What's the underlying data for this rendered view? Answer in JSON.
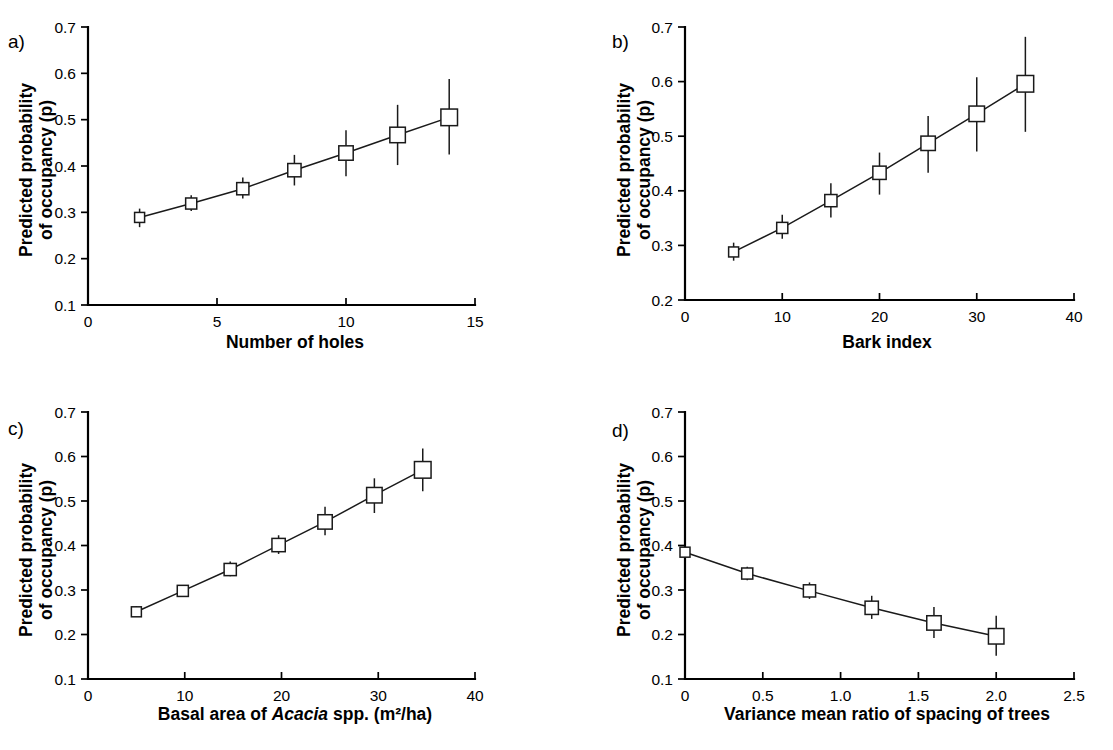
{
  "figure": {
    "panels": [
      {
        "letter": "a)",
        "ylabel_line1": "Predicted probability",
        "ylabel_line2": "of occupancy (p)",
        "xlabel": "Number of holes",
        "xlabel_italic_word": "",
        "xticks": [
          "0",
          "5",
          "10",
          "15"
        ],
        "yticks": [
          "0.7",
          "0.6",
          "0.5",
          "0.4",
          "0.3",
          "0.2",
          "0.1"
        ]
      },
      {
        "letter": "b)",
        "ylabel_line1": "Predicted probability",
        "ylabel_line2": "of occupancy (p)",
        "xlabel": "Bark index",
        "xlabel_italic_word": "",
        "xticks": [
          "0",
          "10",
          "20",
          "30",
          "40"
        ],
        "yticks": [
          "0.7",
          "0.6",
          "0.5",
          "0.4",
          "0.3",
          "0.2"
        ]
      },
      {
        "letter": "c)",
        "ylabel_line1": "Predicted probability",
        "ylabel_line2": "of occupancy (p)",
        "xlabel_pre": "Basal area of ",
        "xlabel_italic_word": "Acacia",
        "xlabel_post": " spp. (m²/ha)",
        "xlabel": "Basal area of Acacia spp. (m²/ha)",
        "xticks": [
          "0",
          "10",
          "20",
          "30",
          "40"
        ],
        "yticks": [
          "0.7",
          "0.6",
          "0.5",
          "0.4",
          "0.3",
          "0.2",
          "0.1"
        ]
      },
      {
        "letter": "d)",
        "ylabel_line1": "Predicted probability",
        "ylabel_line2": "of occupancy (p)",
        "xlabel": "Variance mean ratio of spacing of trees",
        "xlabel_italic_word": "",
        "xticks": [
          "0",
          "0.5",
          "1.0",
          "1.5",
          "2.0",
          "2.5"
        ],
        "yticks": [
          "0.7",
          "0.6",
          "0.5",
          "0.4",
          "0.3",
          "0.2",
          "0.1"
        ]
      }
    ]
  },
  "chart_data": [
    {
      "type": "line",
      "panel": "a",
      "title": "",
      "xlabel": "Number of holes",
      "ylabel": "Predicted probability of occupancy (p)",
      "xlim": [
        0,
        15
      ],
      "ylim": [
        0.1,
        0.7
      ],
      "xticks": [
        0,
        5,
        10,
        15
      ],
      "yticks": [
        0.1,
        0.2,
        0.3,
        0.4,
        0.5,
        0.6,
        0.7
      ],
      "grid": false,
      "legend": null,
      "markers": "open-square",
      "errorbars": true,
      "x": [
        2,
        4,
        6,
        8,
        10,
        12,
        14
      ],
      "y": [
        0.289,
        0.319,
        0.351,
        0.391,
        0.428,
        0.467,
        0.505
      ],
      "yerr_low": [
        0.268,
        0.303,
        0.33,
        0.358,
        0.378,
        0.402,
        0.425
      ],
      "yerr_high": [
        0.308,
        0.337,
        0.375,
        0.424,
        0.477,
        0.532,
        0.588
      ]
    },
    {
      "type": "line",
      "panel": "b",
      "title": "",
      "xlabel": "Bark index",
      "ylabel": "Predicted probability of occupancy (p)",
      "xlim": [
        0,
        40
      ],
      "ylim": [
        0.2,
        0.7
      ],
      "xticks": [
        0,
        10,
        20,
        30,
        40
      ],
      "yticks": [
        0.2,
        0.3,
        0.4,
        0.5,
        0.6,
        0.7
      ],
      "grid": false,
      "legend": null,
      "markers": "open-square",
      "errorbars": true,
      "x": [
        5,
        10,
        15,
        20,
        25,
        30,
        35
      ],
      "y": [
        0.288,
        0.332,
        0.382,
        0.433,
        0.487,
        0.541,
        0.596
      ],
      "yerr_low": [
        0.272,
        0.312,
        0.351,
        0.393,
        0.433,
        0.472,
        0.508
      ],
      "yerr_high": [
        0.305,
        0.356,
        0.414,
        0.47,
        0.537,
        0.608,
        0.682
      ]
    },
    {
      "type": "line",
      "panel": "c",
      "title": "",
      "xlabel": "Basal area of Acacia spp. (m²/ha)",
      "ylabel": "Predicted probability of occupancy (p)",
      "xlim": [
        0,
        40
      ],
      "ylim": [
        0.1,
        0.7
      ],
      "xticks": [
        0,
        10,
        20,
        30,
        40
      ],
      "yticks": [
        0.1,
        0.2,
        0.3,
        0.4,
        0.5,
        0.6,
        0.7
      ],
      "grid": false,
      "legend": null,
      "markers": "open-square",
      "errorbars": true,
      "x": [
        5,
        9.8,
        14.7,
        19.7,
        24.5,
        29.6,
        34.6
      ],
      "y": [
        0.251,
        0.298,
        0.346,
        0.401,
        0.453,
        0.513,
        0.57
      ],
      "yerr_low": [
        0.24,
        0.286,
        0.331,
        0.381,
        0.423,
        0.473,
        0.522
      ],
      "yerr_high": [
        0.264,
        0.311,
        0.364,
        0.423,
        0.487,
        0.551,
        0.618
      ]
    },
    {
      "type": "line",
      "panel": "d",
      "title": "",
      "xlabel": "Variance mean ratio of spacing of trees",
      "ylabel": "Predicted probability of occupancy (p)",
      "xlim": [
        0,
        2.5
      ],
      "ylim": [
        0.1,
        0.7
      ],
      "xticks": [
        0,
        0.5,
        1.0,
        1.5,
        2.0,
        2.5
      ],
      "yticks": [
        0.1,
        0.2,
        0.3,
        0.4,
        0.5,
        0.6,
        0.7
      ],
      "grid": false,
      "legend": null,
      "markers": "open-square",
      "errorbars": true,
      "x": [
        0.0,
        0.4,
        0.8,
        1.2,
        1.6,
        2.0
      ],
      "y": [
        0.385,
        0.337,
        0.298,
        0.26,
        0.226,
        0.196
      ],
      "yerr_low": [
        0.382,
        0.322,
        0.28,
        0.235,
        0.192,
        0.152
      ],
      "yerr_high": [
        0.388,
        0.352,
        0.317,
        0.287,
        0.262,
        0.242
      ]
    }
  ]
}
